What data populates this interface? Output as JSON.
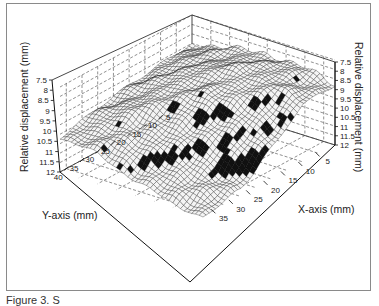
{
  "figure": {
    "caption_partial": "Figure 3. S"
  },
  "chart_data": {
    "type": "surface3d",
    "title": "",
    "zlabel_left": "Relative displacement (mm)",
    "zlabel_right": "Relative displacement (mm)",
    "xlabel": "X-axis (mm)",
    "ylabel": "Y-axis (mm)",
    "z_ticks": [
      "7.5",
      "8",
      "8.5",
      "9",
      "9.5",
      "10",
      "10.5",
      "11",
      "11.5",
      "12"
    ],
    "z_range": [
      7.5,
      12
    ],
    "z_inverted": true,
    "x_ticks": [
      "5",
      "10",
      "15",
      "20",
      "25",
      "30",
      "35"
    ],
    "y_ticks": [
      "5",
      "10",
      "15",
      "20",
      "25",
      "30",
      "35",
      "40"
    ],
    "x_range": [
      0,
      38
    ],
    "y_range": [
      0,
      42
    ],
    "grid": "dashed",
    "surface_description": "Wireframe mesh surface; plateau near z≈8–9 mm across most of the domain with a ridge toward the back (low y), dropping steeply to ~12 mm toward the front corner (high x, high y) forming a dark, dense-mesh steep region",
    "approx_surface_grid": {
      "x": [
        0,
        10,
        20,
        30,
        38
      ],
      "y": [
        0,
        10,
        20,
        30,
        42
      ],
      "z": [
        [
          9.0,
          8.6,
          8.3,
          8.4,
          8.8
        ],
        [
          9.2,
          8.5,
          8.2,
          8.3,
          8.9
        ],
        [
          9.4,
          8.8,
          8.6,
          9.2,
          10.3
        ],
        [
          9.7,
          9.3,
          9.8,
          10.8,
          11.6
        ],
        [
          10.2,
          10.4,
          11.2,
          11.8,
          12.0
        ]
      ]
    }
  }
}
